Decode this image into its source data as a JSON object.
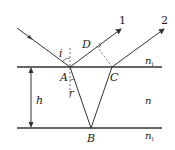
{
  "diagram": {
    "labels": {
      "incident_angle": "i",
      "refraction_angle": "r",
      "point_a": "A",
      "point_b": "B",
      "point_c": "C",
      "point_d": "D",
      "thickness": "h",
      "ray_1": "1",
      "ray_2": "2",
      "medium_top": "n",
      "medium_top_sub": "1",
      "medium_film": "n",
      "medium_bottom": "n",
      "medium_bottom_sub": "1"
    },
    "colors": {
      "line": "#333333",
      "dashed": "#555555"
    }
  }
}
